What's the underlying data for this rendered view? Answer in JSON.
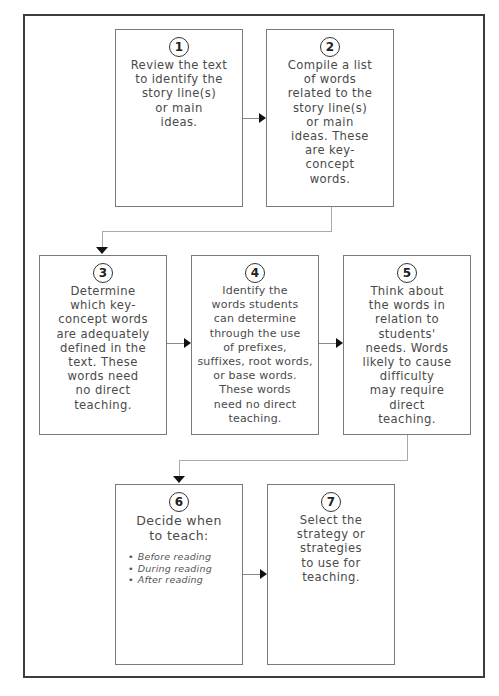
{
  "diagram": {
    "type": "flowchart",
    "steps": [
      {
        "number": "1",
        "text": "Review the text\nto identify the\nstory line(s)\nor main\nideas."
      },
      {
        "number": "2",
        "text": "Compile a list\nof words\nrelated to the\nstory line(s)\nor main\nideas. These\nare key-\nconcept\nwords."
      },
      {
        "number": "3",
        "text": "Determine\nwhich key-\nconcept words\nare adequately\ndefined in the\ntext. These\nwords need\nno direct\nteaching."
      },
      {
        "number": "4",
        "text": "Identify the\nwords students\ncan determine\nthrough the use\nof prefixes,\nsuffixes, root words,\nor base words.\nThese words\nneed no direct\nteaching."
      },
      {
        "number": "5",
        "text": "Think about\nthe words in\nrelation to\nstudents'\nneeds. Words\nlikely to cause\ndifficulty\nmay require\ndirect\nteaching."
      },
      {
        "number": "6",
        "text": "Decide when\nto teach:",
        "bullets": [
          "Before reading",
          "During reading",
          "After reading"
        ]
      },
      {
        "number": "7",
        "text": "Select the\nstrategy or\nstrategies\nto use for\nteaching."
      }
    ],
    "connections": [
      {
        "from": "1",
        "to": "2"
      },
      {
        "from": "2",
        "to": "3"
      },
      {
        "from": "3",
        "to": "4"
      },
      {
        "from": "4",
        "to": "5"
      },
      {
        "from": "5",
        "to": "6"
      },
      {
        "from": "6",
        "to": "7"
      }
    ],
    "colors": {
      "box_border": "#7a7a7a",
      "frame_border": "#3c3c3c",
      "arrow": "#111111",
      "text": "#4a4a4a"
    }
  }
}
